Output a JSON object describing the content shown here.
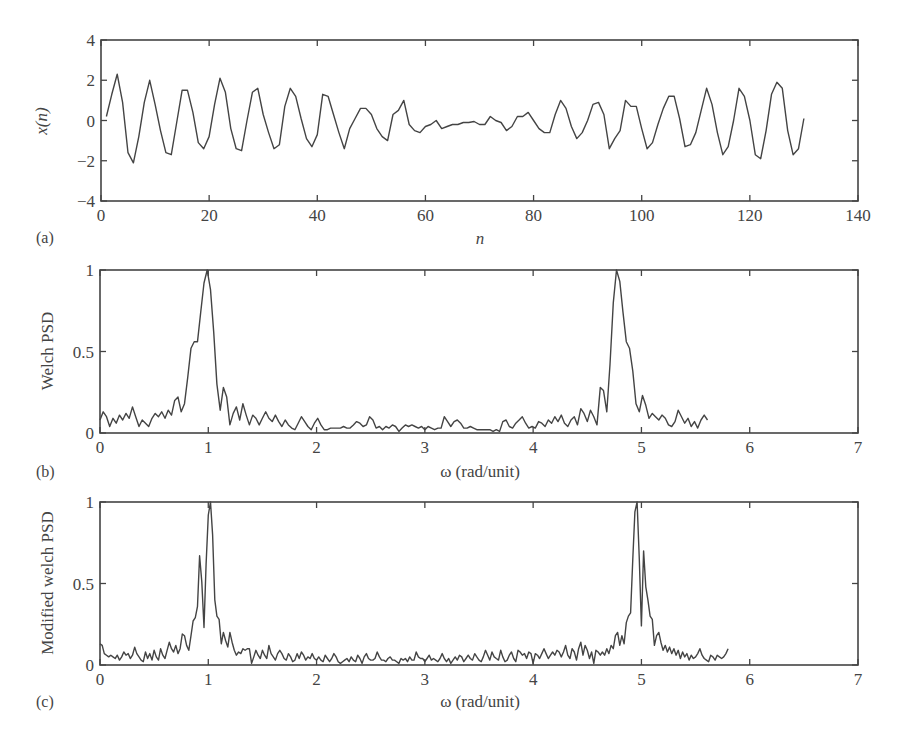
{
  "figure": {
    "panels": [
      {
        "id": "a",
        "label": "(a)",
        "ylabel": "x(n)",
        "xlabel": "n"
      },
      {
        "id": "b",
        "label": "(b)",
        "ylabel": "Welch PSD",
        "xlabel": "ω (rad/unit)"
      },
      {
        "id": "c",
        "label": "(c)",
        "ylabel": "Modified welch PSD",
        "xlabel": "ω (rad/unit)"
      }
    ]
  },
  "chart_data": [
    {
      "type": "line",
      "panel": "(a)",
      "title": "",
      "xlabel": "n",
      "ylabel": "x(n)",
      "xlim": [
        0,
        140
      ],
      "ylim": [
        -4,
        4
      ],
      "xticks": [
        0,
        20,
        40,
        60,
        80,
        100,
        120,
        140
      ],
      "yticks": [
        -4,
        -2,
        0,
        2,
        4
      ],
      "grid": false,
      "x_start": 1,
      "values": [
        0.2,
        1.3,
        2.3,
        0.9,
        -1.6,
        -2.1,
        -0.8,
        0.9,
        2.0,
        0.8,
        -0.5,
        -1.6,
        -1.7,
        -0.1,
        1.5,
        1.5,
        0.4,
        -1.1,
        -1.4,
        -0.8,
        0.8,
        2.1,
        1.4,
        -0.4,
        -1.4,
        -1.5,
        0.0,
        1.4,
        1.6,
        0.3,
        -0.6,
        -1.4,
        -1.2,
        0.7,
        1.6,
        1.2,
        0.1,
        -0.9,
        -1.3,
        -0.7,
        1.3,
        1.2,
        0.3,
        -0.6,
        -1.4,
        -0.4,
        0.1,
        0.6,
        0.6,
        0.3,
        -0.4,
        -0.8,
        -1.0,
        0.3,
        0.5,
        1.0,
        -0.2,
        -0.5,
        -0.6,
        -0.3,
        -0.2,
        0.0,
        -0.4,
        -0.3,
        -0.2,
        -0.2,
        -0.1,
        -0.1,
        -0.05,
        -0.2,
        -0.2,
        0.2,
        0.0,
        -0.1,
        -0.5,
        -0.3,
        0.2,
        0.2,
        0.4,
        0.0,
        -0.4,
        -0.6,
        -0.6,
        0.3,
        1.0,
        0.6,
        -0.3,
        -0.9,
        -0.6,
        0.0,
        0.8,
        0.9,
        0.3,
        -1.4,
        -0.9,
        -0.5,
        1.0,
        0.7,
        0.7,
        -0.4,
        -1.4,
        -1.1,
        -0.2,
        0.6,
        1.2,
        1.2,
        0.1,
        -1.3,
        -1.2,
        -0.6,
        0.5,
        1.6,
        0.8,
        -0.6,
        -1.7,
        -1.3,
        0.0,
        1.6,
        1.2,
        0.0,
        -1.7,
        -1.9,
        -0.5,
        1.3,
        1.9,
        1.6,
        -0.5,
        -1.7,
        -1.4,
        0.1
      ],
      "notes": "Noisy sinusoid, amplitude ~2 at ends, near-zero around n=60-80"
    },
    {
      "type": "line",
      "panel": "(b)",
      "title": "",
      "xlabel": "ω (rad/unit)",
      "ylabel": "Welch PSD",
      "xlim": [
        0,
        7
      ],
      "ylim": [
        0,
        1
      ],
      "xticks": [
        0,
        1,
        2,
        3,
        4,
        5,
        6,
        7
      ],
      "yticks": [
        0,
        0.5,
        1
      ],
      "grid": false,
      "x_step": 0.03,
      "values": [
        0.08,
        0.13,
        0.1,
        0.04,
        0.09,
        0.06,
        0.11,
        0.08,
        0.12,
        0.09,
        0.16,
        0.1,
        0.04,
        0.08,
        0.06,
        0.04,
        0.09,
        0.12,
        0.1,
        0.13,
        0.09,
        0.14,
        0.11,
        0.2,
        0.22,
        0.13,
        0.18,
        0.34,
        0.52,
        0.56,
        0.56,
        0.74,
        0.92,
        1.0,
        0.88,
        0.62,
        0.3,
        0.14,
        0.28,
        0.22,
        0.05,
        0.12,
        0.16,
        0.08,
        0.18,
        0.11,
        0.05,
        0.11,
        0.09,
        0.05,
        0.09,
        0.13,
        0.09,
        0.07,
        0.11,
        0.07,
        0.04,
        0.08,
        0.05,
        0.03,
        0.02,
        0.06,
        0.1,
        0.07,
        0.04,
        0.02,
        0.06,
        0.09,
        0.05,
        0.02,
        0.02,
        0.03,
        0.03,
        0.03,
        0.03,
        0.04,
        0.03,
        0.03,
        0.05,
        0.07,
        0.06,
        0.04,
        0.05,
        0.1,
        0.08,
        0.03,
        0.04,
        0.02,
        0.04,
        0.03,
        0.05,
        0.04,
        0.01,
        0.03,
        0.05,
        0.04,
        0.05,
        0.04,
        0.03,
        0.04,
        0.02,
        0.04,
        0.03,
        0.02,
        0.03,
        0.03,
        0.1,
        0.07,
        0.04,
        0.07,
        0.08,
        0.06,
        0.03,
        0.03,
        0.04,
        0.03,
        0.02,
        0.02,
        0.02,
        0.02,
        0.02,
        0.01,
        0.02,
        0.01,
        0.07,
        0.08,
        0.04,
        0.03,
        0.06,
        0.08,
        0.1,
        0.06,
        0.03,
        0.04,
        0.03,
        0.07,
        0.06,
        0.04,
        0.08,
        0.06,
        0.1,
        0.07,
        0.11,
        0.06,
        0.04,
        0.08,
        0.1,
        0.05,
        0.15,
        0.12,
        0.07,
        0.14,
        0.1,
        0.05,
        0.28,
        0.26,
        0.13,
        0.42,
        0.8,
        1.0,
        0.93,
        0.74,
        0.56,
        0.52,
        0.38,
        0.18,
        0.13,
        0.23,
        0.17,
        0.09,
        0.12,
        0.1,
        0.08,
        0.11,
        0.09,
        0.05,
        0.04,
        0.07,
        0.14,
        0.1,
        0.06,
        0.09,
        0.04,
        0.07,
        0.03,
        0.08,
        0.11,
        0.08
      ],
      "annotations": [
        "Peak at ω≈1.0 (value 1.0)",
        "Peak at ω≈5.28 (value 1.0)"
      ]
    },
    {
      "type": "line",
      "panel": "(c)",
      "title": "",
      "xlabel": "ω (rad/unit)",
      "ylabel": "Modified welch PSD",
      "xlim": [
        0,
        7
      ],
      "ylim": [
        0,
        1
      ],
      "xticks": [
        0,
        1,
        2,
        3,
        4,
        5,
        6,
        7
      ],
      "yticks": [
        0,
        0.5,
        1
      ],
      "grid": false,
      "x_step": 0.02,
      "values": [
        0.13,
        0.12,
        0.07,
        0.06,
        0.05,
        0.06,
        0.05,
        0.04,
        0.06,
        0.03,
        0.05,
        0.08,
        0.06,
        0.07,
        0.04,
        0.06,
        0.11,
        0.07,
        0.05,
        0.03,
        0.02,
        0.08,
        0.04,
        0.07,
        0.03,
        0.09,
        0.05,
        0.03,
        0.1,
        0.06,
        0.04,
        0.09,
        0.14,
        0.1,
        0.08,
        0.12,
        0.07,
        0.1,
        0.19,
        0.18,
        0.12,
        0.09,
        0.18,
        0.27,
        0.29,
        0.36,
        0.67,
        0.51,
        0.23,
        0.62,
        0.92,
        1.0,
        0.8,
        0.4,
        0.3,
        0.28,
        0.13,
        0.2,
        0.15,
        0.11,
        0.2,
        0.14,
        0.09,
        0.06,
        0.08,
        0.07,
        0.1,
        0.09,
        0.1,
        0.1,
        0.01,
        0.05,
        0.09,
        0.06,
        0.04,
        0.09,
        0.06,
        0.04,
        0.12,
        0.07,
        0.05,
        0.03,
        0.07,
        0.09,
        0.07,
        0.04,
        0.03,
        0.07,
        0.05,
        0.02,
        0.03,
        0.07,
        0.04,
        0.08,
        0.06,
        0.03,
        0.05,
        0.04,
        0.07,
        0.04,
        0.03,
        0.05,
        0.03,
        0.02,
        0.06,
        0.04,
        0.02,
        0.04,
        0.07,
        0.05,
        0.02,
        0.01,
        0.02,
        0.03,
        0.04,
        0.02,
        0.05,
        0.03,
        0.02,
        0.06,
        0.04,
        0.01,
        0.05,
        0.07,
        0.04,
        0.03,
        0.03,
        0.04,
        0.08,
        0.05,
        0.03,
        0.03,
        0.02,
        0.04,
        0.05,
        0.03,
        0.03,
        0.02,
        0.01,
        0.04,
        0.03,
        0.04,
        0.02,
        0.05,
        0.03,
        0.03,
        0.08,
        0.05,
        0.04,
        0.04,
        0.02,
        0.04,
        0.06,
        0.03,
        0.04,
        0.03,
        0.02,
        0.04,
        0.07,
        0.04,
        0.02,
        0.04,
        0.01,
        0.03,
        0.05,
        0.03,
        0.06,
        0.05,
        0.02,
        0.04,
        0.06,
        0.04,
        0.03,
        0.07,
        0.05,
        0.03,
        0.02,
        0.05,
        0.09,
        0.06,
        0.03,
        0.08,
        0.05,
        0.04,
        0.03,
        0.09,
        0.05,
        0.02,
        0.03,
        0.06,
        0.08,
        0.04,
        0.02,
        0.09,
        0.08,
        0.06,
        0.07,
        0.04,
        0.08,
        0.07,
        0.01,
        0.07,
        0.06,
        0.04,
        0.07,
        0.1,
        0.07,
        0.04,
        0.06,
        0.08,
        0.06,
        0.09,
        0.08,
        0.05,
        0.08,
        0.12,
        0.06,
        0.04,
        0.1,
        0.08,
        0.03,
        0.1,
        0.14,
        0.06,
        0.12,
        0.09,
        0.04,
        0.08,
        0.01,
        0.09,
        0.08,
        0.06,
        0.08,
        0.06,
        0.1,
        0.07,
        0.12,
        0.1,
        0.18,
        0.2,
        0.12,
        0.18,
        0.13,
        0.26,
        0.3,
        0.32,
        0.65,
        0.94,
        1.0,
        0.65,
        0.24,
        0.7,
        0.48,
        0.4,
        0.3,
        0.28,
        0.12,
        0.18,
        0.2,
        0.14,
        0.09,
        0.12,
        0.08,
        0.11,
        0.07,
        0.1,
        0.06,
        0.09,
        0.04,
        0.08,
        0.05,
        0.07,
        0.03,
        0.06,
        0.04,
        0.05,
        0.07,
        0.1,
        0.06,
        0.04,
        0.03,
        0.02,
        0.06,
        0.05,
        0.03,
        0.06,
        0.05,
        0.04,
        0.05,
        0.07,
        0.1
      ],
      "annotations": [
        "Peak at ω≈1.0 (value 1.0), side peak ≈0.67 at ω≈0.93",
        "Peak at ω≈5.28 (value 1.0), side peak ≈0.68 at ω≈5.35"
      ]
    }
  ]
}
